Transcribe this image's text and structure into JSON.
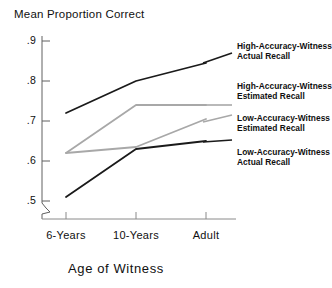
{
  "chart_data": {
    "type": "line",
    "title": "",
    "ylabel": "Mean Proportion Correct",
    "xlabel": "Age of Witness",
    "categories": [
      "6-Years",
      "10-Years",
      "Adult"
    ],
    "ytick_labels": [
      ".9",
      ".8",
      ".7",
      ".6",
      ".5"
    ],
    "ytick_values": [
      0.9,
      0.8,
      0.7,
      0.6,
      0.5
    ],
    "ylim": [
      0.46,
      0.92
    ],
    "grid": false,
    "axis_break": true,
    "legend_position": "right",
    "series": [
      {
        "name": "High-Accuracy-Witness Actual Recall",
        "label_line1": "High-Accuracy-Witness",
        "label_line2": "Actual Recall",
        "color": "#1a1a1a",
        "values": [
          0.72,
          0.8,
          0.845
        ]
      },
      {
        "name": "High-Accuracy-Witness Estimated Recall",
        "label_line1": "High-Accuracy-Witness",
        "label_line2": "Estimated Recall",
        "color": "#a8a8a8",
        "values": [
          0.62,
          0.74,
          0.74
        ]
      },
      {
        "name": "Low-Accuracy-Witness Estimated Recall",
        "label_line1": "Low-Accuracy-Witness",
        "label_line2": "Estimated Recall",
        "color": "#a8a8a8",
        "values": [
          0.62,
          0.635,
          0.705
        ]
      },
      {
        "name": "Low-Accuracy-Witness Actual Recall",
        "label_line1": "Low-Accuracy-Witness",
        "label_line2": "Actual Recall",
        "color": "#1a1a1a",
        "values": [
          0.51,
          0.63,
          0.65
        ]
      }
    ]
  }
}
